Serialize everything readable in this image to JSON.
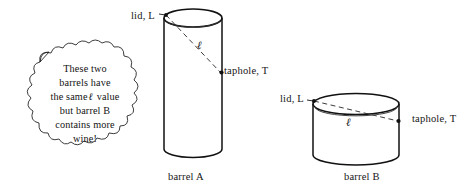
{
  "figure": {
    "kind": "geometry-diagram",
    "background_color": "#ffffff",
    "stroke_color": "#111111",
    "callout": {
      "shape": "cloud-bubble",
      "lines": [
        "These two",
        "barrels have",
        "the same",
        "value",
        "but barrel B",
        "contains more",
        "wine!"
      ],
      "line1": "These two",
      "line2": "barrels have",
      "line3_a": "the same",
      "line3_symbol": "ℓ",
      "line3_b": "value",
      "line4": "but barrel B",
      "line5": "contains more",
      "line6": "wine!"
    },
    "barrel_a": {
      "name": "barrel A",
      "lid_label": "lid, L",
      "taphole_label": "taphole, T",
      "diagonal_label": "ℓ",
      "shape": "tall narrow cylinder"
    },
    "barrel_b": {
      "name": "barrel B",
      "lid_label": "lid, L",
      "taphole_label": "taphole, T",
      "diagonal_label": "ℓ",
      "shape": "short wide cylinder"
    }
  }
}
